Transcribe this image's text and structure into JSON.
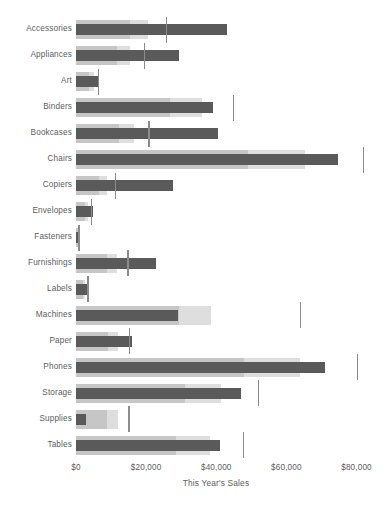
{
  "chart_data": {
    "type": "bar",
    "subtype": "bullet",
    "title": "",
    "xlabel": "This Year's Sales",
    "ylabel": "",
    "xlim": [
      0,
      86700
    ],
    "grid": false,
    "legend": false,
    "tick_labels": [
      "$0",
      "$20,000",
      "$40,000",
      "$60,000",
      "$80,000"
    ],
    "tick_values": [
      0,
      20000,
      40000,
      60000,
      80000
    ],
    "categories": [
      "Accessories",
      "Appliances",
      "Art",
      "Binders",
      "Bookcases",
      "Chairs",
      "Copiers",
      "Envelopes",
      "Fasteners",
      "Furnishings",
      "Labels",
      "Machines",
      "Paper",
      "Phones",
      "Storage",
      "Supplies",
      "Tables"
    ],
    "series": [
      {
        "name": "This Year's Sales",
        "role": "measure",
        "values": [
          43100,
          29400,
          6600,
          39000,
          40500,
          74700,
          27700,
          4900,
          400,
          22800,
          3400,
          29100,
          16000,
          71000,
          47000,
          2900,
          41000
        ]
      },
      {
        "name": "Last Year's Sales (reference)",
        "role": "reference",
        "values": [
          25600,
          19300,
          6200,
          44800,
          20600,
          81800,
          11100,
          4300,
          700,
          14600,
          3200,
          63800,
          15100,
          80000,
          51800,
          14900,
          47600
        ]
      },
      {
        "name": "60% of Last Year's Sales",
        "role": "band-inner",
        "values": [
          15400,
          11600,
          3700,
          26900,
          12400,
          49100,
          6700,
          2600,
          400,
          8800,
          1900,
          29300,
          9100,
          48000,
          31100,
          8900,
          28600
        ]
      },
      {
        "name": "80% of Last Year's Sales",
        "role": "band-outer",
        "values": [
          20500,
          15400,
          5000,
          35800,
          16500,
          65400,
          8900,
          3400,
          560,
          11700,
          2600,
          38500,
          12100,
          64000,
          41400,
          11900,
          38100
        ]
      }
    ],
    "colors": {
      "measure": "#5a5a5a",
      "reference": "#8c8c8c",
      "band_inner": "#c6c6c6",
      "band_outer": "#dedede",
      "text": "#5d5e60",
      "background": "#ffffff"
    }
  }
}
